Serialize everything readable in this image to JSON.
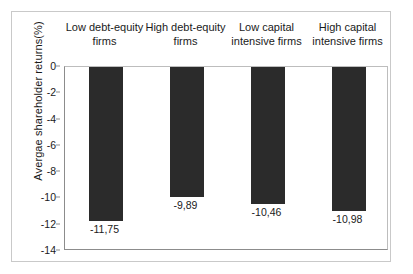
{
  "chart_data": {
    "type": "bar",
    "title": "",
    "subtitle": "",
    "xlabel": "",
    "ylabel": "Avergae shareholder returns(%)",
    "categories": [
      "Low debt-equity\nfirms",
      "High debt-equity\nfirms",
      "Low capital\nintensive firms",
      "High capital\nintensive firms"
    ],
    "values": [
      -11.75,
      -9.89,
      -10.46,
      -10.98
    ],
    "value_labels": [
      "-11,75",
      "-9,89",
      "-10,46",
      "-10,98"
    ],
    "ylim": [
      -14,
      0
    ],
    "ytick_values": [
      0,
      -2,
      -4,
      -6,
      -8,
      -10,
      -12,
      -14
    ],
    "ytick_labels": [
      "0",
      "-2",
      "-4",
      "-6",
      "-8",
      "-10",
      "-12",
      "-14"
    ],
    "grid": false,
    "legend": null,
    "bar_color": "#2b2b2b",
    "axis_color": "#8c8c8c",
    "frame_color": "#c9c9c9",
    "background": "#ffffff",
    "orientation": "vertical",
    "bars_hang_from_zero": true
  }
}
